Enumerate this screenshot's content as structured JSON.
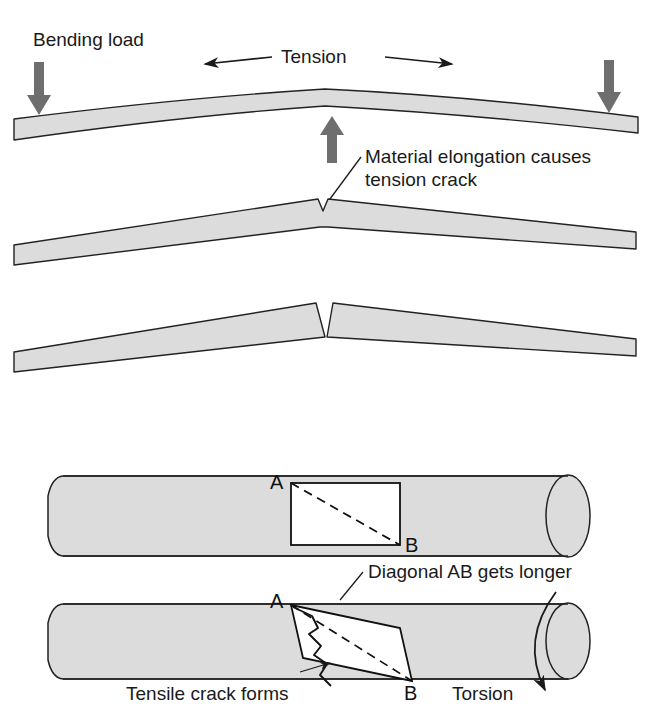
{
  "figure": {
    "background_color": "#ffffff",
    "body_fill": "#dcdcdc",
    "outline_color": "#222222",
    "arrow_fill": "#6e6e6e",
    "text_color": "#1a1a1a"
  },
  "bending": {
    "load_label": "Bending load",
    "tension_label": "Tension",
    "crack_caption_line1": "Material elongation causes",
    "crack_caption_line2": "tension crack",
    "icons": {
      "load_arrow_left": "down-arrow-icon",
      "load_arrow_right": "down-arrow-icon",
      "reaction_arrow_center": "up-arrow-icon",
      "tension_arrow": "double-headed-arrow-icon",
      "leader_line": "leader-line-icon"
    },
    "stages": [
      {
        "name": "beam-bowed",
        "description": "Beam bowed upward under three point bending"
      },
      {
        "name": "beam-notched",
        "description": "Beam bent sharply with small tension notch at apex"
      },
      {
        "name": "beam-cracked",
        "description": "Beam bent with open wedge crack at apex"
      }
    ]
  },
  "torsion": {
    "diagonal_caption": "Diagonal AB gets longer",
    "tensile_caption": "Tensile crack forms",
    "torsion_label": "Torsion",
    "point_a": "A",
    "point_b": "B",
    "icons": {
      "torsion_arrow": "curved-arrow-icon",
      "diagonal_leader": "leader-line-icon",
      "tensile_leader": "leader-line-icon",
      "dashed_diagonal": "dashed-line-icon",
      "jagged_crack": "crack-icon"
    },
    "stages": [
      {
        "name": "shaft-undeformed",
        "description": "Cylindrical shaft with square element, dashed diagonal AB"
      },
      {
        "name": "shaft-twisted",
        "description": "Shaft twisted, element sheared into parallelogram with jagged tensile crack"
      }
    ]
  }
}
